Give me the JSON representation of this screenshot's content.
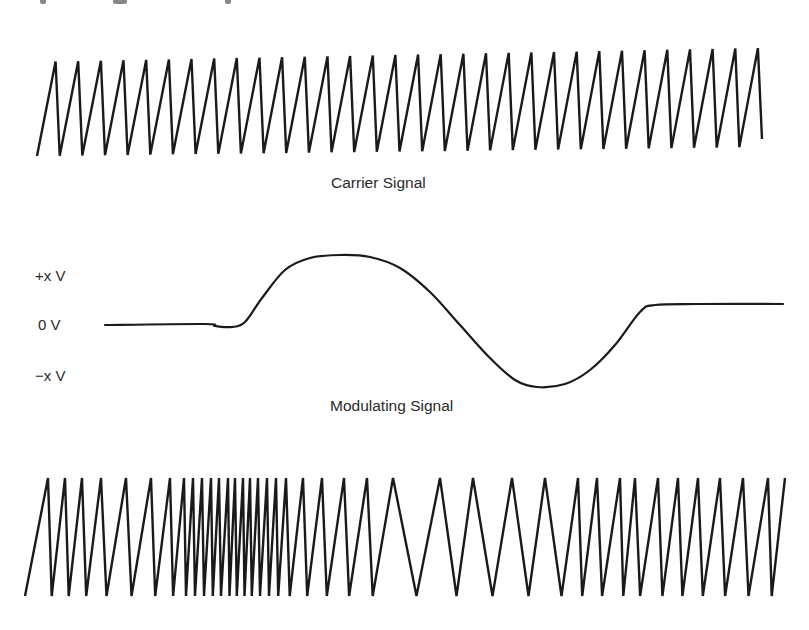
{
  "figure": {
    "carrier_caption": "Carrier Signal",
    "modulating_caption": "Modulating Signal",
    "axis_labels": {
      "positive": "+x V",
      "zero": "0 V",
      "negative": "−x V"
    },
    "stroke_color": "#1a1a1a",
    "text_color": "#2a2a2a"
  },
  "carrier": {
    "type": "sawtooth",
    "x_start": 37,
    "x_end": 762,
    "teeth": 32,
    "top_left_y": 62,
    "top_right_y": 48,
    "bottom_left_y": 156,
    "bottom_right_y": 147
  },
  "modulating": {
    "points": [
      [
        105,
        325
      ],
      [
        205,
        324
      ],
      [
        215,
        326
      ],
      [
        232,
        327
      ],
      [
        245,
        322
      ],
      [
        262,
        298
      ],
      [
        285,
        270
      ],
      [
        310,
        258
      ],
      [
        340,
        255
      ],
      [
        370,
        257
      ],
      [
        400,
        268
      ],
      [
        430,
        292
      ],
      [
        460,
        325
      ],
      [
        490,
        358
      ],
      [
        515,
        380
      ],
      [
        537,
        387
      ],
      [
        565,
        384
      ],
      [
        590,
        370
      ],
      [
        615,
        345
      ],
      [
        640,
        312
      ],
      [
        655,
        305
      ],
      [
        700,
        304
      ],
      [
        783,
        304
      ]
    ]
  },
  "fm": {
    "type": "frequency-modulated sawtooth",
    "peaks_x": [
      48,
      65,
      82,
      101,
      126,
      151,
      170,
      184,
      193,
      202,
      211,
      219,
      228,
      235,
      243,
      250,
      258,
      267,
      276,
      286,
      303,
      322,
      344,
      367,
      393,
      440,
      473,
      512,
      545,
      578,
      597,
      620,
      635,
      658,
      678,
      698,
      720,
      743,
      768,
      785
    ],
    "top_y": 478,
    "bottom_y": 596
  }
}
